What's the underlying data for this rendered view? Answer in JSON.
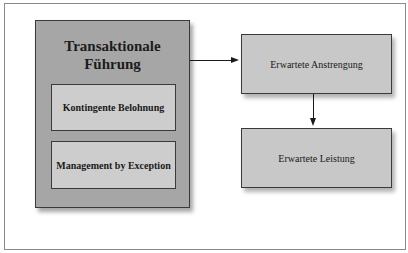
{
  "diagram": {
    "main": {
      "title_line1": "Transaktionale",
      "title_line2": "Führung",
      "components": [
        {
          "label": "Kontingente Belohnung"
        },
        {
          "label": "Management by Exception"
        }
      ]
    },
    "outcomes": [
      {
        "label": "Erwartete Anstrengung"
      },
      {
        "label": "Erwartete Leistung"
      }
    ],
    "edges": [
      {
        "from": "Transaktionale Führung",
        "to": "Erwartete Anstrengung"
      },
      {
        "from": "Erwartete Anstrengung",
        "to": "Erwartete Leistung"
      }
    ],
    "colors": {
      "main_fill": "#a6a6a6",
      "inner_fill": "#cdcdcd",
      "outcome_fill": "#c8c8c8",
      "border": "#3a3a3a"
    }
  }
}
